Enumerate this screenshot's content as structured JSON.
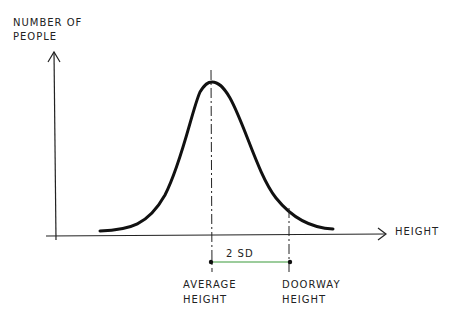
{
  "diagram": {
    "y_axis_label_line1": "NUMBER OF",
    "y_axis_label_line2": "PEOPLE",
    "x_axis_label": "HEIGHT",
    "interval_label": "2 SD",
    "mean_label_line1": "AVERAGE",
    "mean_label_line2": "HEIGHT",
    "doorway_label_line1": "DOORWAY",
    "doorway_label_line2": "HEIGHT",
    "colors": {
      "ink": "#111111",
      "interval": "#3a9a3a"
    }
  }
}
